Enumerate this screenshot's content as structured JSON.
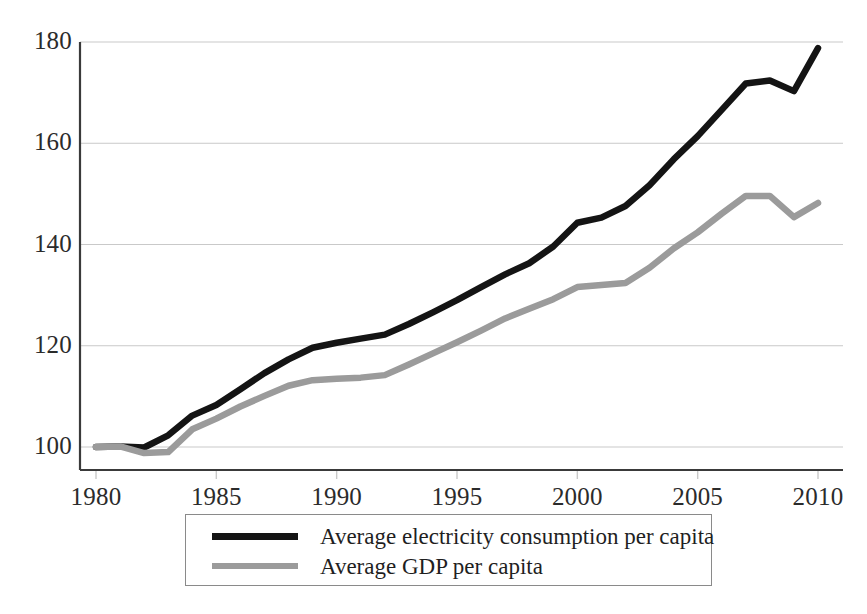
{
  "chart_data": {
    "type": "line",
    "title": "",
    "xlabel": "",
    "ylabel": "",
    "xlim": [
      1980,
      2010
    ],
    "ylim": [
      100,
      180
    ],
    "xticks": [
      1980,
      1985,
      1990,
      1995,
      2000,
      2005,
      2010
    ],
    "yticks": [
      100,
      120,
      140,
      160,
      180
    ],
    "grid": true,
    "grid_axis": "y",
    "legend_position": "below-axes",
    "x": [
      1980,
      1981,
      1982,
      1983,
      1984,
      1985,
      1986,
      1987,
      1988,
      1989,
      1990,
      1991,
      1992,
      1993,
      1994,
      1995,
      1996,
      1997,
      1998,
      1999,
      2000,
      2001,
      2002,
      2003,
      2004,
      2005,
      2006,
      2007,
      2008,
      2009,
      2010
    ],
    "series": [
      {
        "name": "Average electricity consumption per capita",
        "color": "#141414",
        "width": 6.5,
        "values": [
          100.0,
          100.1,
          99.9,
          102.3,
          106.2,
          108.3,
          111.4,
          114.6,
          117.3,
          119.6,
          120.6,
          121.4,
          122.2,
          124.3,
          126.6,
          129.0,
          131.6,
          134.1,
          136.3,
          139.6,
          144.3,
          145.3,
          147.6,
          151.7,
          156.8,
          161.4,
          166.6,
          171.8,
          172.4,
          170.3,
          178.8
        ]
      },
      {
        "name": "Average GDP per capita",
        "color": "#9b9b9b",
        "width": 6.5,
        "values": [
          100.0,
          100.1,
          98.8,
          99.0,
          103.5,
          105.6,
          108.0,
          110.1,
          112.1,
          113.2,
          113.5,
          113.7,
          114.2,
          116.3,
          118.5,
          120.7,
          123.0,
          125.4,
          127.3,
          129.2,
          131.6,
          132.0,
          132.4,
          135.4,
          139.2,
          142.4,
          146.1,
          149.6,
          149.6,
          145.4,
          148.2
        ]
      }
    ]
  },
  "axis": {
    "y_tick_labels": [
      "180",
      "160",
      "140",
      "120",
      "100"
    ],
    "x_tick_labels": [
      "1980",
      "1985",
      "1990",
      "1995",
      "2000",
      "2005",
      "2010"
    ],
    "axis_color": "#3a3a3a",
    "grid_color": "#c9c9c9"
  },
  "legend": {
    "border_color": "#8a8a8a",
    "entries": [
      {
        "label": "Average electricity consumption per capita",
        "color": "#141414"
      },
      {
        "label": "Average GDP per capita",
        "color": "#9b9b9b"
      }
    ]
  }
}
